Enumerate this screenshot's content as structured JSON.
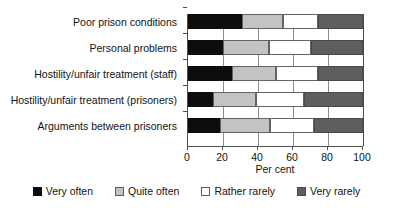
{
  "chart_data": {
    "type": "bar",
    "orientation": "horizontal",
    "stacked": true,
    "normalized": true,
    "title": "",
    "xlabel": "Per cent",
    "ylabel": "",
    "xlim": [
      0,
      100
    ],
    "xticks": [
      0,
      20,
      40,
      60,
      80,
      100
    ],
    "xticklabels": [
      "0",
      "20",
      "40",
      "60",
      "80",
      "100"
    ],
    "grid": "vertical",
    "legend_position": "bottom",
    "categories": [
      "Poor prison conditions",
      "Personal problems",
      "Hostility/unfair treatment (staff)",
      "Hostility/unfair treatment (prisoners)",
      "Arguments between prisoners"
    ],
    "series": [
      {
        "name": "Very often",
        "color": "#0d0d0d",
        "values": [
          31,
          20,
          25,
          14,
          18
        ]
      },
      {
        "name": "Quite often",
        "color": "#c3c3c3",
        "values": [
          23,
          26,
          25,
          25,
          29
        ]
      },
      {
        "name": "Rather rarely",
        "color": "#ffffff",
        "values": [
          20,
          24,
          24,
          27,
          25
        ]
      },
      {
        "name": "Very rarely",
        "color": "#5e5e5e",
        "values": [
          26,
          30,
          26,
          34,
          28
        ]
      }
    ]
  }
}
